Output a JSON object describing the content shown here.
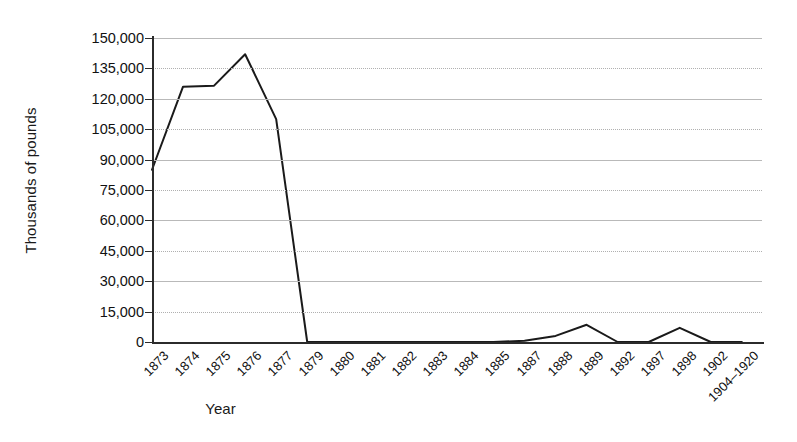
{
  "chart_data": {
    "type": "line",
    "title": "",
    "xlabel": "Year",
    "ylabel": "Thousands of pounds",
    "ylim": [
      0,
      150000
    ],
    "grid": true,
    "legend": "none",
    "categories": [
      "1873",
      "1874",
      "1875",
      "1876",
      "1877",
      "1879",
      "1880",
      "1881",
      "1882",
      "1883",
      "1884",
      "1885",
      "1887",
      "1888",
      "1889",
      "1892",
      "1897",
      "1898",
      "1902",
      "1904–1920"
    ],
    "values": [
      85000,
      126000,
      126500,
      142000,
      110000,
      0,
      0,
      0,
      0,
      0,
      0,
      0,
      600,
      3000,
      8500,
      0,
      0,
      7000,
      0,
      0
    ],
    "ytick_values": [
      0,
      15000,
      30000,
      45000,
      60000,
      75000,
      90000,
      105000,
      120000,
      135000,
      150000
    ],
    "ytick_labels": [
      "0",
      "15,000",
      "30,000",
      "45,000",
      "60,000",
      "75,000",
      "90,000",
      "105,000",
      "120,000",
      "135,000",
      "150,000"
    ],
    "series": [
      {
        "name": "series-1",
        "color": "#1a1a1a",
        "values": [
          85000,
          126000,
          126500,
          142000,
          110000,
          0,
          0,
          0,
          0,
          0,
          0,
          0,
          600,
          3000,
          8500,
          0,
          0,
          7000,
          0,
          0
        ]
      }
    ]
  },
  "axes": {
    "y_title": "Thousands of pounds",
    "x_title": "Year"
  },
  "style": {
    "line_color": "#1a1a1a",
    "grid_color": "#b9b9b9",
    "axis_color": "#2b2b2b",
    "background": "#ffffff"
  }
}
